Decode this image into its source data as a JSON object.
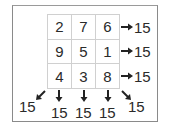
{
  "grid": {
    "rows": [
      [
        "2",
        "7",
        "6"
      ],
      [
        "9",
        "5",
        "1"
      ],
      [
        "4",
        "3",
        "8"
      ]
    ]
  },
  "sums": {
    "rows": [
      "15",
      "15",
      "15"
    ],
    "columns": [
      "15",
      "15",
      "15"
    ],
    "diagonal_anti": "15",
    "diagonal_main": "15"
  },
  "colors": {
    "frame": "#8a8a8a",
    "gridline": "#d0d0d0",
    "text": "#2a2a2a"
  }
}
